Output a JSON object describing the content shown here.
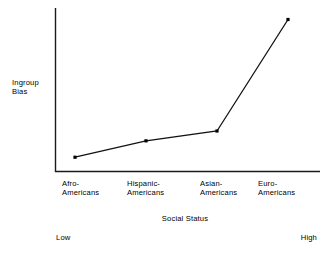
{
  "chart_data": {
    "type": "line",
    "title": "",
    "subtitle": "",
    "xlabel": "Social Status",
    "ylabel": "Ingroup\nBias",
    "ylabel_lines": [
      "Ingroup",
      "Bias"
    ],
    "categories": [
      "Afro-\nAmericans",
      "Hispanic-\nAmericans",
      "Asian-\nAmericans",
      "Euro-\nAmericans"
    ],
    "category_lines": [
      [
        "Afro-",
        "Americans"
      ],
      [
        "Hispanic-",
        "Americans"
      ],
      [
        "Asian-",
        "Americans"
      ],
      [
        "Euro-",
        "Americans"
      ]
    ],
    "series": [
      {
        "name": "Ingroup Bias",
        "values": [
          0.09,
          0.19,
          0.25,
          0.93
        ]
      }
    ],
    "x_axis_anchors": {
      "low": "Low",
      "high": "High"
    },
    "ylim": [
      0,
      1
    ],
    "xlim": [
      0,
      1
    ],
    "grid": false,
    "legend": false,
    "ticks": {
      "x": [],
      "y": []
    },
    "marker": "square",
    "line_color": "#111111",
    "axis_color": "#1a1a1a",
    "background": "#ffffff"
  },
  "geometry": {
    "axis_origin_x": 55,
    "axis_origin_y": 172,
    "axis_top_y": 8,
    "axis_right_x": 320,
    "points_px": [
      {
        "x": 75,
        "y": 158
      },
      {
        "x": 148,
        "y": 141
      },
      {
        "x": 222,
        "y": 131
      },
      {
        "x": 288,
        "y": 20
      }
    ]
  }
}
